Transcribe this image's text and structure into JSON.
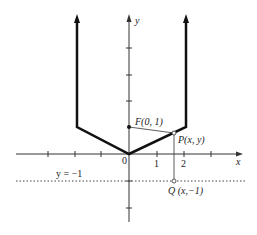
{
  "diagram": {
    "type": "coordinate-plot",
    "axes": {
      "x_label": "x",
      "y_label": "y",
      "origin_label": "0",
      "x_tick_labels": [
        "1",
        "2"
      ]
    },
    "curve": {
      "description": "piecewise V-shaped curve opening upward",
      "color": "#111111"
    },
    "points": {
      "focus": {
        "label": "F(0, 1)"
      },
      "point_p": {
        "label": "P(x, y)"
      },
      "point_q": {
        "label": "Q (x,−1)"
      }
    },
    "directrix": {
      "label": "y = −1",
      "style": "dotted"
    }
  }
}
